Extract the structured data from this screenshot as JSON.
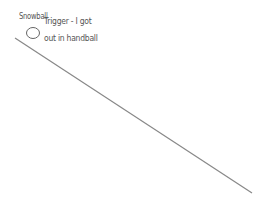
{
  "diagram": {
    "object_label": "Snowball",
    "annotation_line1": "Trigger - I got",
    "annotation_line2": "out in handball",
    "slope": {
      "x1": 15,
      "y1": 38,
      "x2": 252,
      "y2": 193,
      "color": "#888888"
    },
    "ball": {
      "cx": 33,
      "cy": 33,
      "r": 6.5,
      "color": "#666666"
    }
  }
}
